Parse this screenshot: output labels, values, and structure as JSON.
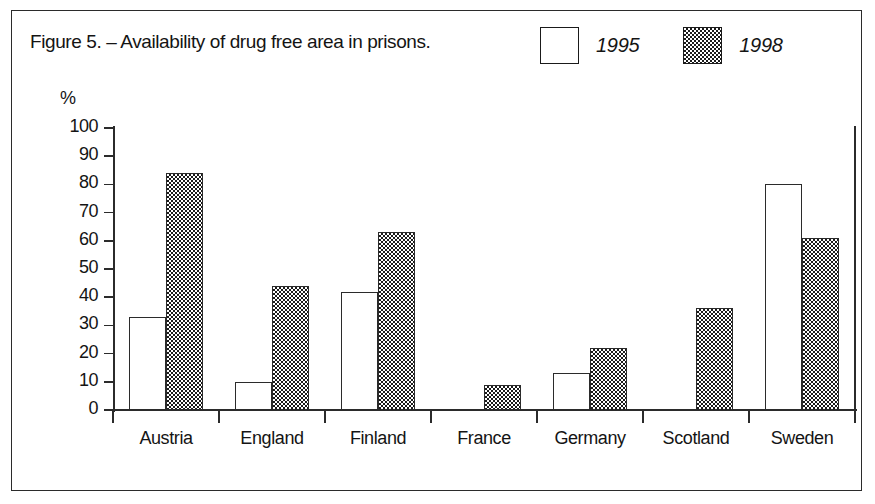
{
  "figure": {
    "title": "Figure 5. – Availability of drug free area in prisons.",
    "percent_axis_symbol": "%"
  },
  "legend": {
    "position": "top-right",
    "entries": [
      {
        "label": "1995",
        "swatch": "white-square-icon",
        "fill": "#ffffff"
      },
      {
        "label": "1998",
        "swatch": "checkered-square-icon",
        "fill": "#1b1b1b"
      }
    ]
  },
  "chart_data": {
    "type": "bar",
    "title": "Figure 5. – Availability of drug free area in prisons.",
    "xlabel": "",
    "ylabel": "%",
    "ylim": [
      0,
      100
    ],
    "yticks": [
      0,
      10,
      20,
      30,
      40,
      50,
      60,
      70,
      80,
      90,
      100
    ],
    "grid": false,
    "legend_position": "top-right",
    "categories": [
      "Austria",
      "England",
      "Finland",
      "France",
      "Germany",
      "Scotland",
      "Sweden"
    ],
    "series": [
      {
        "name": "1995",
        "values": [
          33,
          10,
          42,
          null,
          13,
          null,
          80
        ]
      },
      {
        "name": "1998",
        "values": [
          84,
          44,
          63,
          9,
          22,
          36,
          61
        ]
      }
    ]
  }
}
